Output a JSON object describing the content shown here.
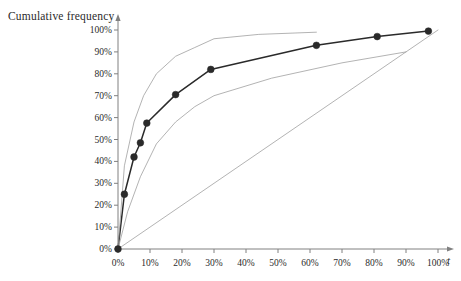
{
  "chart_data": {
    "type": "line",
    "title": "",
    "ylabel": "Cumulative frequency",
    "xlabel": "t",
    "xlim": [
      0,
      100
    ],
    "ylim": [
      0,
      100
    ],
    "grid": false,
    "legend": "none",
    "x_tick_labels": [
      "0%",
      "10%",
      "20%",
      "30%",
      "40%",
      "50%",
      "60%",
      "70%",
      "80%",
      "90%",
      "100%"
    ],
    "x_ticks": [
      0,
      10,
      20,
      30,
      40,
      50,
      60,
      70,
      80,
      90,
      100
    ],
    "y_tick_labels": [
      "0%",
      "10%",
      "20%",
      "30%",
      "40%",
      "50%",
      "60%",
      "70%",
      "80%",
      "90%",
      "100%"
    ],
    "y_ticks": [
      0,
      10,
      20,
      30,
      40,
      50,
      60,
      70,
      80,
      90,
      100
    ],
    "series": [
      {
        "name": "Cumulative frequency curve",
        "style": "line-with-markers",
        "color": "#2a2a2a",
        "marker": "filled-circle",
        "x": [
          0,
          2,
          5,
          7,
          9,
          18,
          29,
          62,
          81,
          97
        ],
        "y": [
          0,
          25,
          42,
          48.5,
          57.5,
          70.5,
          82,
          93,
          97,
          99.5
        ]
      },
      {
        "name": "Upper band",
        "style": "line",
        "color": "#9a9a9a",
        "marker": "none",
        "x": [
          0,
          2,
          5,
          8,
          12,
          18,
          24,
          30,
          44,
          62
        ],
        "y": [
          0,
          38,
          58,
          70,
          80,
          88,
          92,
          96,
          98,
          99
        ]
      },
      {
        "name": "Lower band",
        "style": "line",
        "color": "#9a9a9a",
        "marker": "none",
        "x": [
          0,
          3,
          7,
          12,
          18,
          24,
          30,
          48,
          70,
          90
        ],
        "y": [
          0,
          17,
          33,
          48,
          58,
          65,
          70,
          78,
          85,
          90
        ]
      },
      {
        "name": "Line of equality",
        "style": "line",
        "color": "#9a9a9a",
        "marker": "none",
        "x": [
          0,
          100
        ],
        "y": [
          0,
          100
        ]
      }
    ]
  },
  "axes": {
    "y_title": "Cumulative frequency",
    "x_title": "t"
  },
  "colors": {
    "curve": "#2a2a2a",
    "band": "#9a9a9a",
    "axis": "#808080",
    "text": "#2b2b2b"
  }
}
